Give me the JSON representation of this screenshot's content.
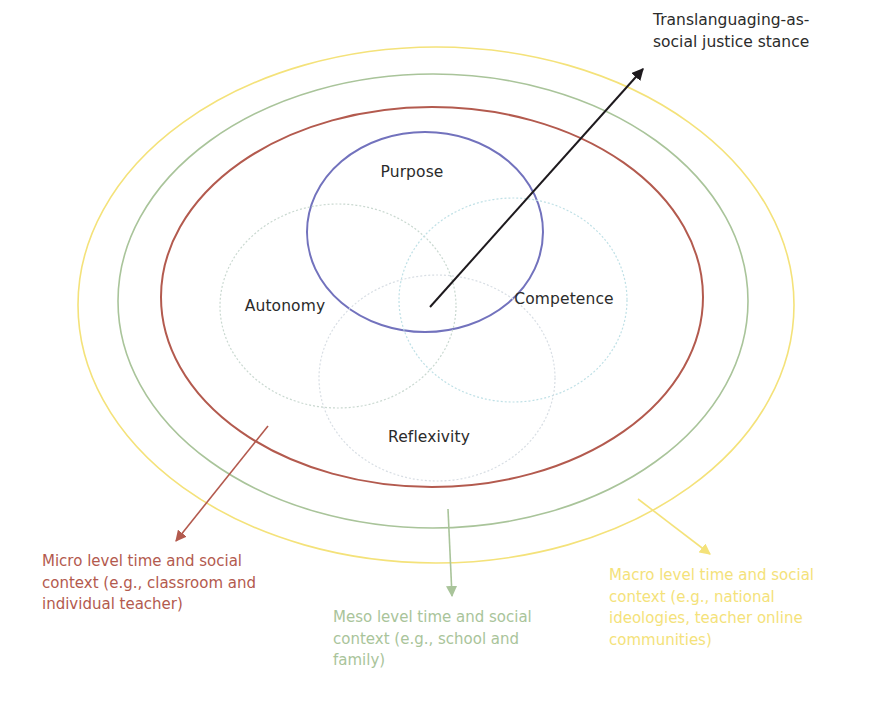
{
  "diagram": {
    "colors": {
      "micro": "#b35a4e",
      "meso": "#a9c49a",
      "macro": "#f4e27a",
      "purpose": "#7272bd",
      "autonomy": "#c9d8d0",
      "competence": "#bfe0e6",
      "reflexivity": "#d8dee4",
      "stance": "#1e1a1e",
      "text": "#2b2b2b"
    },
    "context_rings": [
      {
        "id": "macro",
        "cx": 436,
        "cy": 305,
        "rx": 358,
        "ry": 258,
        "color": "#f4e27a",
        "width": 1.6
      },
      {
        "id": "meso",
        "cx": 433,
        "cy": 301,
        "rx": 315,
        "ry": 227,
        "color": "#a9c49a",
        "width": 1.6
      },
      {
        "id": "micro",
        "cx": 432,
        "cy": 297,
        "rx": 271,
        "ry": 190,
        "color": "#b35a4e",
        "width": 2
      }
    ],
    "components": [
      {
        "id": "purpose",
        "label": "Purpose",
        "cx": 425,
        "cy": 232,
        "rx": 118,
        "ry": 100,
        "color": "#7272bd",
        "dashed": false,
        "label_x": 412,
        "label_y": 172
      },
      {
        "id": "autonomy",
        "label": "Autonomy",
        "cx": 338,
        "cy": 306,
        "rx": 118,
        "ry": 102,
        "color": "#c9d8d0",
        "dashed": true,
        "label_x": 285,
        "label_y": 306
      },
      {
        "id": "competence",
        "label": "Competence",
        "cx": 513,
        "cy": 300,
        "rx": 114,
        "ry": 102,
        "color": "#bfe0e6",
        "dashed": true,
        "label_x": 564,
        "label_y": 299
      },
      {
        "id": "reflexivity",
        "label": "Reflexivity",
        "cx": 437,
        "cy": 378,
        "rx": 118,
        "ry": 103,
        "color": "#d8dee4",
        "dashed": true,
        "label_x": 429,
        "label_y": 437
      }
    ],
    "stance": {
      "label": "Translanguaging-as-\nsocial justice stance",
      "arrow": {
        "x1": 430,
        "y1": 307,
        "x2": 643,
        "y2": 69,
        "color": "#1e1a1e"
      },
      "label_x": 653,
      "label_y": 9
    },
    "contexts": [
      {
        "id": "micro",
        "text": "Micro level time and social\ncontext (e.g., classroom and\nindividual teacher)",
        "color": "#b35a4e",
        "arrow": {
          "x1": 268,
          "y1": 426,
          "x2": 176,
          "y2": 541
        },
        "label_x": 42,
        "label_y": 551
      },
      {
        "id": "meso",
        "text": "Meso level time and social\ncontext (e.g., school and\nfamily)",
        "color": "#a9c49a",
        "arrow": {
          "x1": 448,
          "y1": 509,
          "x2": 452,
          "y2": 596
        },
        "label_x": 333,
        "label_y": 607
      },
      {
        "id": "macro",
        "text": "Macro level time and social\ncontext (e.g., national\nideologies, teacher online\ncommunities)",
        "color": "#f4e27a",
        "arrow": {
          "x1": 638,
          "y1": 499,
          "x2": 710,
          "y2": 554
        },
        "label_x": 609,
        "label_y": 565
      }
    ]
  }
}
